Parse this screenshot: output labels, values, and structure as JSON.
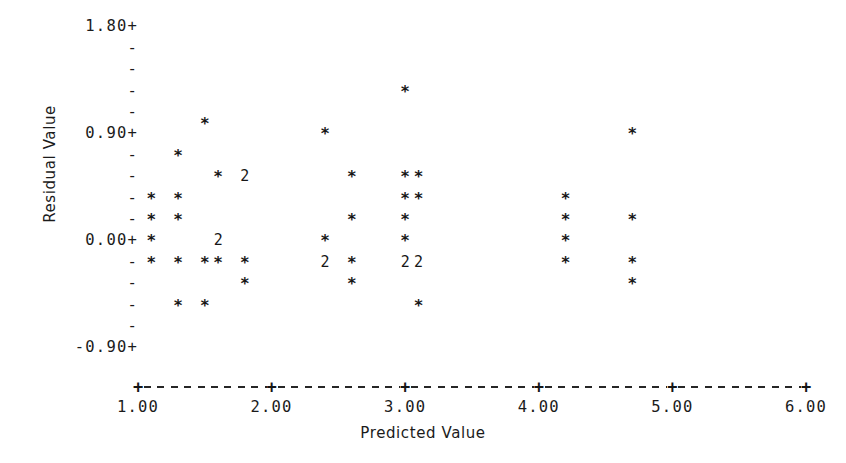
{
  "chart_data": {
    "type": "scatter",
    "title": "",
    "xlabel": "Predicted Value",
    "ylabel": "Residual Value",
    "xlim": [
      1.0,
      6.0
    ],
    "ylim": [
      -0.9,
      1.8
    ],
    "grid": false,
    "legend": null,
    "plot_style": "ascii-character-plot",
    "point_glyph": "*",
    "overplot_glyph_note": "digit shows number of coincident points",
    "x_ticks": [
      "1.00",
      "2.00",
      "3.00",
      "4.00",
      "5.00",
      "6.00"
    ],
    "x_tick_values": [
      1.0,
      2.0,
      3.0,
      4.0,
      5.0,
      6.0
    ],
    "y_ticks": [
      "1.80+",
      "-",
      "-",
      "-",
      "-",
      "0.90+",
      "-",
      "-",
      "-",
      "-",
      "0.00+",
      "-",
      "-",
      "-",
      "-",
      "-0.90+"
    ],
    "y_tick_labeled": [
      "1.80",
      "0.90",
      "0.00",
      "-0.90"
    ],
    "y_tick_labeled_values": [
      1.8,
      0.9,
      0.0,
      -0.9
    ],
    "y_row_step": 0.18,
    "rows": [
      {
        "y": 1.8,
        "label": "1.80+",
        "points": []
      },
      {
        "y": 1.62,
        "label": "-",
        "points": []
      },
      {
        "y": 1.44,
        "label": "-",
        "points": []
      },
      {
        "y": 1.26,
        "label": "-",
        "points": [
          {
            "x": 3.0,
            "n": 1
          }
        ]
      },
      {
        "y": 1.08,
        "label": "-",
        "points": []
      },
      {
        "y": 0.99,
        "label": "",
        "points": [
          {
            "x": 1.5,
            "n": 1
          }
        ]
      },
      {
        "y": 0.9,
        "label": "0.90+",
        "points": [
          {
            "x": 2.4,
            "n": 1
          },
          {
            "x": 4.7,
            "n": 1
          }
        ]
      },
      {
        "y": 0.72,
        "label": "-",
        "points": [
          {
            "x": 1.3,
            "n": 1
          }
        ]
      },
      {
        "y": 0.54,
        "label": "-",
        "points": [
          {
            "x": 1.6,
            "n": 1
          },
          {
            "x": 1.8,
            "n": 2
          },
          {
            "x": 2.6,
            "n": 1
          },
          {
            "x": 3.0,
            "n": 1
          },
          {
            "x": 3.1,
            "n": 1
          }
        ]
      },
      {
        "y": 0.36,
        "label": "-",
        "points": [
          {
            "x": 1.1,
            "n": 1
          },
          {
            "x": 1.3,
            "n": 1
          },
          {
            "x": 3.0,
            "n": 1
          },
          {
            "x": 3.1,
            "n": 1
          },
          {
            "x": 4.2,
            "n": 1
          }
        ]
      },
      {
        "y": 0.18,
        "label": "-",
        "points": [
          {
            "x": 1.1,
            "n": 1
          },
          {
            "x": 1.3,
            "n": 1
          },
          {
            "x": 2.6,
            "n": 1
          },
          {
            "x": 3.0,
            "n": 1
          },
          {
            "x": 4.2,
            "n": 1
          },
          {
            "x": 4.7,
            "n": 1
          }
        ]
      },
      {
        "y": 0.0,
        "label": "0.00+",
        "points": [
          {
            "x": 1.1,
            "n": 1
          },
          {
            "x": 1.6,
            "n": 2
          },
          {
            "x": 2.4,
            "n": 1
          },
          {
            "x": 3.0,
            "n": 1
          },
          {
            "x": 4.2,
            "n": 1
          }
        ]
      },
      {
        "y": -0.18,
        "label": "-",
        "points": [
          {
            "x": 1.1,
            "n": 1
          },
          {
            "x": 1.3,
            "n": 1
          },
          {
            "x": 1.5,
            "n": 1
          },
          {
            "x": 1.6,
            "n": 1
          },
          {
            "x": 1.8,
            "n": 1
          },
          {
            "x": 2.4,
            "n": 2
          },
          {
            "x": 2.6,
            "n": 1
          },
          {
            "x": 3.0,
            "n": 2
          },
          {
            "x": 3.1,
            "n": 2
          },
          {
            "x": 4.2,
            "n": 1
          },
          {
            "x": 4.7,
            "n": 1
          }
        ]
      },
      {
        "y": -0.36,
        "label": "-",
        "points": [
          {
            "x": 1.8,
            "n": 1
          },
          {
            "x": 2.6,
            "n": 1
          },
          {
            "x": 4.7,
            "n": 1
          }
        ]
      },
      {
        "y": -0.54,
        "label": "-",
        "points": [
          {
            "x": 1.3,
            "n": 1
          },
          {
            "x": 1.5,
            "n": 1
          },
          {
            "x": 3.1,
            "n": 1
          }
        ]
      },
      {
        "y": -0.72,
        "label": "-",
        "points": []
      },
      {
        "y": -0.9,
        "label": "-0.90+",
        "points": []
      }
    ]
  },
  "axes": {
    "y_title": "Residual Value",
    "x_title": "Predicted Value",
    "y_labels": [
      {
        "text": "1.80+",
        "value": 1.8
      },
      {
        "text": "-",
        "value": 1.62
      },
      {
        "text": "-",
        "value": 1.44
      },
      {
        "text": "-",
        "value": 1.26
      },
      {
        "text": "-",
        "value": 1.08
      },
      {
        "text": "0.90+",
        "value": 0.9
      },
      {
        "text": "-",
        "value": 0.72
      },
      {
        "text": "-",
        "value": 0.54
      },
      {
        "text": "-",
        "value": 0.36
      },
      {
        "text": "-",
        "value": 0.18
      },
      {
        "text": "0.00+",
        "value": 0.0
      },
      {
        "text": "-",
        "value": -0.18
      },
      {
        "text": "-",
        "value": -0.36
      },
      {
        "text": "-",
        "value": -0.54
      },
      {
        "text": "-",
        "value": -0.72
      },
      {
        "text": "-0.90+",
        "value": -0.9
      }
    ],
    "x_labels": [
      {
        "text": "1.00",
        "value": 1.0
      },
      {
        "text": "2.00",
        "value": 2.0
      },
      {
        "text": "3.00",
        "value": 3.0
      },
      {
        "text": "4.00",
        "value": 4.0
      },
      {
        "text": "5.00",
        "value": 5.0
      },
      {
        "text": "6.00",
        "value": 6.0
      }
    ],
    "x_tick_glyph": "+",
    "x_axis_fill_glyph": "-"
  },
  "colors": {
    "background": "#ffffff",
    "ink": "#1b1b1b",
    "mark": "#171717"
  }
}
